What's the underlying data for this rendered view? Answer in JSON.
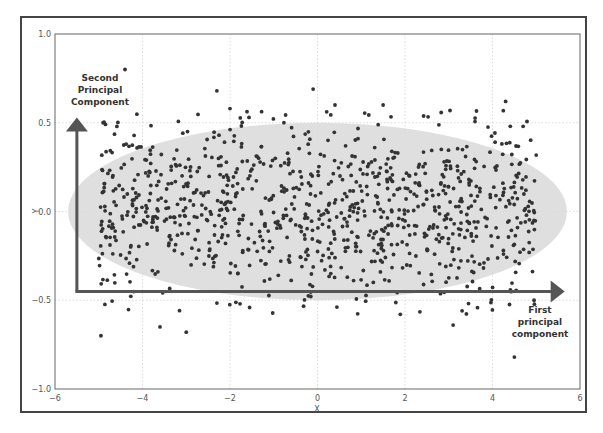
{
  "chart_data": {
    "type": "scatter",
    "title": "",
    "xlabel": "X",
    "ylabel": "Y",
    "xlim": [
      -6,
      6
    ],
    "ylim": [
      -1.0,
      1.0
    ],
    "x_ticks": [
      "−6",
      "−4",
      "−2",
      "0",
      "2",
      "4",
      "6"
    ],
    "x_tick_values": [
      -6,
      -4,
      -2,
      0,
      2,
      4,
      6
    ],
    "y_ticks": [
      "1.0",
      "0.5",
      "0.0",
      "−0.5",
      "−1.0"
    ],
    "y_tick_values": [
      1.0,
      0.5,
      0.0,
      -0.5,
      -1.0
    ],
    "grid": true,
    "series": [
      {
        "name": "data points",
        "color": "#333333",
        "count_approx": 1000,
        "distribution": {
          "x": "uniform(-5, 5)",
          "y": "normal(0, 0.25)"
        },
        "notable_points": [
          {
            "x": -4.4,
            "y": 0.8
          },
          {
            "x": -4.95,
            "y": -0.7
          },
          {
            "x": -3.0,
            "y": -0.68
          },
          {
            "x": 4.5,
            "y": -0.82
          },
          {
            "x": -2.3,
            "y": 0.68
          },
          {
            "x": -0.1,
            "y": 0.69
          },
          {
            "x": 4.3,
            "y": 0.62
          },
          {
            "x": 1.5,
            "y": 0.6
          },
          {
            "x": -2.0,
            "y": 0.58
          },
          {
            "x": 0.4,
            "y": 0.6
          },
          {
            "x": -3.6,
            "y": -0.65
          },
          {
            "x": 3.1,
            "y": -0.64
          },
          {
            "x": 4.95,
            "y": -0.5
          },
          {
            "x": 4.7,
            "y": 0.48
          },
          {
            "x": -4.9,
            "y": 0.5
          }
        ]
      }
    ],
    "annotations": [
      {
        "text": "Second Principal Component",
        "lines": [
          "Second",
          "Principal",
          "Component"
        ],
        "position": "top-left, above vertical arrow"
      },
      {
        "text": "First principal component",
        "lines": [
          "First",
          "principal",
          "component"
        ],
        "position": "bottom-right, below horizontal arrow"
      }
    ],
    "overlays": {
      "ellipse": {
        "cx": 0.0,
        "cy": 0.0,
        "rx": 5.7,
        "ry": 0.5,
        "color": "#d9d9d9"
      },
      "vertical_arrow": {
        "x": -5.5,
        "y_from": -0.45,
        "y_to": 0.53,
        "color": "#555555"
      },
      "horizontal_arrow": {
        "y": -0.45,
        "x_from": -5.5,
        "x_to": 5.65,
        "color": "#555555"
      }
    }
  },
  "labels": {
    "x_axis": "X",
    "y_axis": "Y",
    "pc2": [
      "Second",
      "Principal",
      "Component"
    ],
    "pc1": [
      "First",
      "principal",
      "component"
    ]
  },
  "colors": {
    "dot": "#333333",
    "ellipse": "#d9d9d9",
    "arrow": "#555555",
    "grid": "#cccccc",
    "frame": "#444444"
  }
}
